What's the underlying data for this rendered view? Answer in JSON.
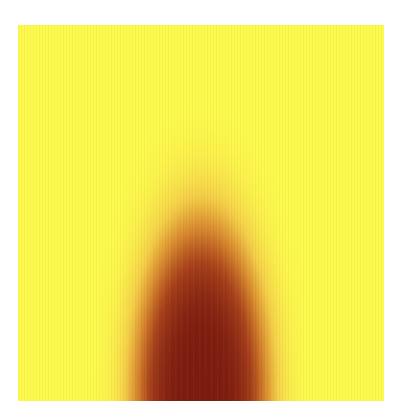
{
  "chart_data": {
    "type": "heatmap",
    "title": "",
    "xlabel": "",
    "ylabel": "",
    "axes_visible": false,
    "colorbar": false,
    "colormap": {
      "name": "yellow-to-darkred",
      "stops": [
        {
          "value": 0.0,
          "color": "#fdfa4e"
        },
        {
          "value": 0.25,
          "color": "#f6d04a"
        },
        {
          "value": 0.5,
          "color": "#d98a30"
        },
        {
          "value": 0.75,
          "color": "#a8421c"
        },
        {
          "value": 1.0,
          "color": "#7a1a10"
        }
      ]
    },
    "plot_region": {
      "x": 18,
      "y": 25,
      "width": 366,
      "height": 376
    },
    "feature": {
      "description": "Single dome-shaped high-intensity region rising from the bottom edge, centered horizontally; background uniformly low intensity",
      "center_x_fraction": 0.5,
      "base_y_fraction": 1.0,
      "peak_top_y_fraction": 0.4,
      "half_width_at_base_fraction": 0.3,
      "max_intensity": 1.0,
      "background_intensity": 0.0
    }
  }
}
